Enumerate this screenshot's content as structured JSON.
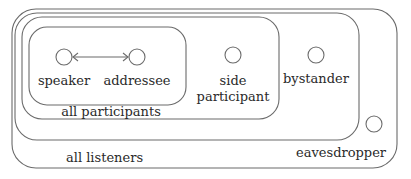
{
  "diagram": {
    "type": "nested-sets",
    "stroke_color": "#6b6b6b",
    "text_color": "#2a2a2a",
    "regions": [
      {
        "id": "all-listeners-outer",
        "label": "all listeners"
      },
      {
        "id": "overhearers",
        "label": ""
      },
      {
        "id": "all-participants",
        "label": "all participants"
      },
      {
        "id": "ratified-core",
        "label": ""
      }
    ],
    "nodes": {
      "speaker": "speaker",
      "addressee": "addressee",
      "side_participant_line1": "side",
      "side_participant_line2": "participant",
      "bystander": "bystander",
      "eavesdropper": "eavesdropper"
    },
    "labels": {
      "all_participants": "all participants",
      "all_listeners": "all listeners"
    },
    "edges": [
      {
        "from": "speaker",
        "to": "addressee",
        "style": "bidirectional-arrow"
      }
    ]
  }
}
